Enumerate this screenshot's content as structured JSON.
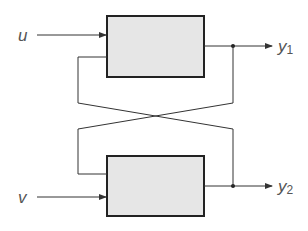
{
  "diagram": {
    "type": "cross-coupled feedback block diagram",
    "inputs": [
      {
        "label": "u"
      },
      {
        "label": "v"
      }
    ],
    "outputs": [
      {
        "label": "y",
        "subscript": "1"
      },
      {
        "label": "y",
        "subscript": "2"
      }
    ],
    "blocks": [
      {
        "name": "upper-block",
        "fill": "#e6e6e6"
      },
      {
        "name": "lower-block",
        "fill": "#e6e6e6"
      }
    ],
    "colors": {
      "line": "#333333",
      "block_fill": "#e6e6e6",
      "block_stroke": "#222222",
      "label": "#555555"
    }
  }
}
